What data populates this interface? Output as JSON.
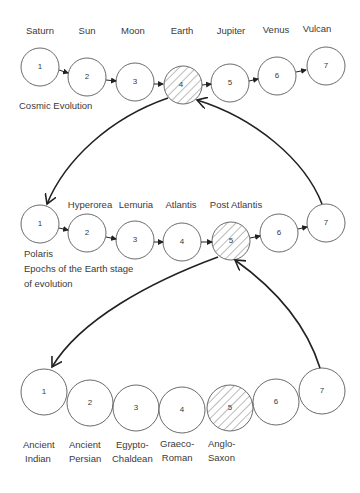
{
  "diagram": {
    "rows": [
      {
        "id": "cosmic",
        "caption": "Cosmic Evolution",
        "labels": [
          "Saturn",
          "Sun",
          "Moon",
          "Earth",
          "Jupiter",
          "Venus",
          "Vulcan"
        ],
        "circles": [
          "1",
          "2",
          "3",
          "4",
          "5",
          "6",
          "7"
        ],
        "highlighted": 4
      },
      {
        "id": "earth-epochs",
        "caption_lines": [
          "Polaris",
          "Epochs of the Earth stage",
          "of evolution"
        ],
        "labels": [
          "Hyperorea",
          "Lemuria",
          "Atlantis",
          "Post Atlantis"
        ],
        "circles": [
          "1",
          "2",
          "3",
          "4",
          "5",
          "6",
          "7"
        ],
        "highlighted": 5
      },
      {
        "id": "cultural-epochs",
        "labels": [
          [
            "Ancient",
            "Indian"
          ],
          [
            "Ancient",
            "Persian"
          ],
          [
            "Egypto-",
            "Chaldean"
          ],
          [
            "Graeco-",
            "Roman"
          ],
          [
            "Anglo-",
            "Saxon"
          ]
        ],
        "circles": [
          "1",
          "2",
          "3",
          "4",
          "5",
          "6",
          "7"
        ],
        "highlighted": 5
      }
    ]
  }
}
